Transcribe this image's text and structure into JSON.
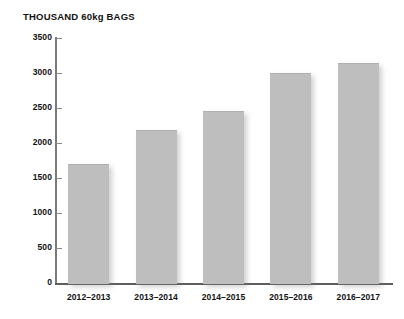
{
  "chart_data": {
    "type": "bar",
    "title": "THOUSAND 60kg BAGS",
    "xlabel": "",
    "ylabel": "",
    "ylim": [
      0,
      3500
    ],
    "yticks": [
      0,
      500,
      1000,
      1500,
      2000,
      2500,
      3000,
      3500
    ],
    "ytick_labels": [
      "0",
      "500",
      "1000",
      "1500",
      "2000",
      "2500",
      "3000",
      "3500"
    ],
    "grid": false,
    "legend": "none",
    "bar_color": "#bebebe",
    "axis_color": "#7b7b7b",
    "text_color": "#111111",
    "categories": [
      "2012–2013",
      "2013–2014",
      "2014–2015",
      "2015–2016",
      "2016–2017"
    ],
    "values": [
      1700,
      2180,
      2460,
      3000,
      3150
    ]
  }
}
